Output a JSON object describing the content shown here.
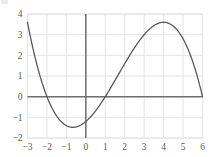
{
  "chart_data": {
    "type": "line",
    "title": "",
    "subtitle": "",
    "xlabel": "",
    "ylabel": "",
    "xlim": [
      -3,
      6
    ],
    "ylim": [
      -2,
      4
    ],
    "grid": true,
    "legend": null,
    "xticks": [
      "-3",
      "-2",
      "-1",
      "0",
      "1",
      "2",
      "3",
      "4",
      "5",
      "6"
    ],
    "xtick_values": [
      -3,
      -2,
      -1,
      0,
      1,
      2,
      3,
      4,
      5,
      6
    ],
    "yticks": [
      "-2",
      "-1",
      "0",
      "1",
      "2",
      "3",
      "4"
    ],
    "ytick_values": [
      -2,
      -1,
      0,
      1,
      2,
      3,
      4
    ],
    "series": [
      {
        "name": "cubic curve",
        "color": "#59595b",
        "roots": [
          -2,
          1,
          6
        ],
        "local_maximum": {
          "x": 4,
          "y": 3.55
        },
        "local_minimum": {
          "x": -0.65,
          "y": -1.6
        },
        "y_intercept": -1.2,
        "x": [
          -3.0,
          -2.8,
          -2.6,
          -2.4,
          -2.2,
          -2.0,
          -1.8,
          -1.6,
          -1.4,
          -1.2,
          -1.0,
          -0.8,
          -0.65,
          -0.4,
          -0.2,
          0.0,
          0.2,
          0.4,
          0.6,
          0.8,
          1.0,
          1.2,
          1.4,
          1.6,
          1.8,
          2.0,
          2.2,
          2.4,
          2.6,
          2.8,
          3.0,
          3.2,
          3.4,
          3.6,
          3.8,
          4.0,
          4.2,
          4.4,
          4.6,
          4.8,
          5.0,
          5.2,
          5.4,
          5.6,
          5.8,
          6.0
        ],
        "y": [
          3.6,
          2.88,
          2.21,
          1.58,
          1.01,
          0.48,
          0.0,
          -0.43,
          -0.82,
          -1.15,
          -1.4,
          -1.57,
          -1.6,
          -1.58,
          -1.44,
          -1.2,
          -0.92,
          -0.58,
          -0.2,
          0.23,
          0.7,
          1.2,
          1.71,
          2.22,
          2.71,
          3.2,
          3.6,
          3.9,
          4.1,
          4.2,
          4.2,
          4.1,
          3.9,
          3.7,
          3.6,
          3.55,
          3.5,
          3.35,
          3.1,
          2.7,
          2.2,
          1.75,
          1.3,
          0.9,
          0.45,
          0.0
        ]
      }
    ]
  },
  "chart_style": {
    "axis_line_color": "#6e6e70",
    "grid_color": "#e4e4e8",
    "frame_color": "#e4e4e8",
    "tick_label_color": "#58585a",
    "background": "#ffffff"
  }
}
